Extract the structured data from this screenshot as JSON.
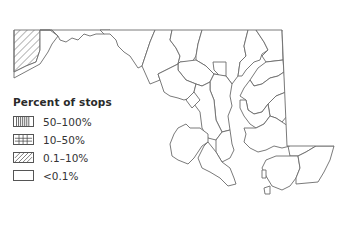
{
  "map": {
    "region": "Maryland counties",
    "line_color": "#6b6b6b",
    "hatched_county": "Garrett"
  },
  "legend": {
    "title": "Percent of stops",
    "items": [
      {
        "label": "50–100%",
        "pattern": "vertical-lines"
      },
      {
        "label": "10–50%",
        "pattern": "grid"
      },
      {
        "label": "0.1–10%",
        "pattern": "diagonal-lines"
      },
      {
        "label": "<0.1%",
        "pattern": "empty"
      }
    ]
  }
}
